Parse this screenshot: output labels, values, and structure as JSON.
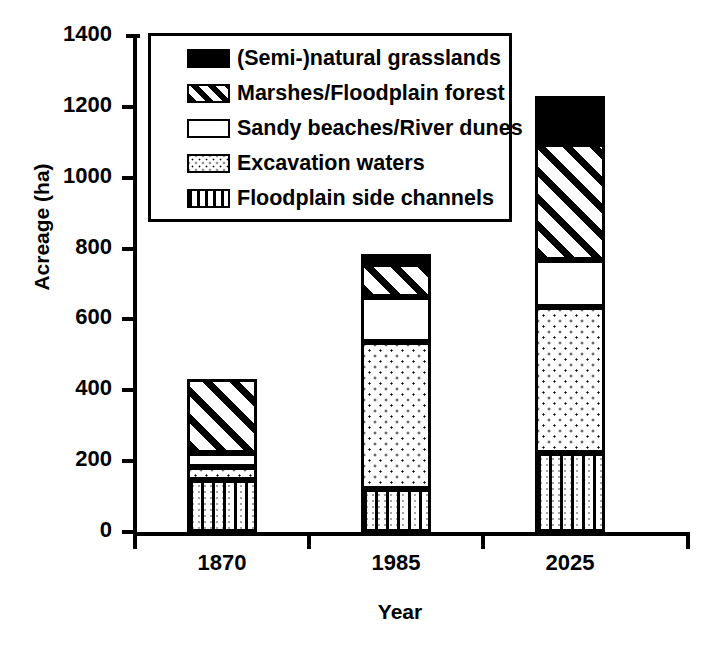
{
  "chart_data": {
    "type": "bar",
    "stacked": true,
    "title": "",
    "subtitle": "",
    "xlabel": "Year",
    "ylabel": "Acreage (ha)",
    "categories": [
      "1870",
      "1985",
      "2025"
    ],
    "ylim": [
      0,
      1400
    ],
    "ytick_step": 200,
    "ytick_labels": [
      "0",
      "200",
      "400",
      "600",
      "800",
      "1000",
      "1200",
      "1400"
    ],
    "ytick_values": [
      0,
      200,
      400,
      600,
      800,
      1000,
      1200,
      1400
    ],
    "grid": false,
    "legend_position": "upper left inside plot",
    "units": "ha",
    "series": [
      {
        "name": "Floodplain side channels",
        "fill": "fill-vert",
        "values": [
          147,
          121,
          224
        ]
      },
      {
        "name": "Excavation waters",
        "fill": "fill-dots",
        "values": [
          37,
          416,
          411
        ]
      },
      {
        "name": "Sandy beaches/River dunes",
        "fill": "fill-white",
        "values": [
          40,
          127,
          133
        ]
      },
      {
        "name": "Marshes/Floodplain forest",
        "fill": "fill-diag",
        "values": [
          207,
          93,
          328
        ]
      },
      {
        "name": "(Semi-)natural grasslands",
        "fill": "fill-solid",
        "values": [
          0,
          28,
          136
        ]
      }
    ],
    "stack_totals": [
      431,
      785,
      1232
    ]
  },
  "legend": {
    "items": [
      {
        "label": "(Semi-)natural grasslands",
        "fill": "fill-solid"
      },
      {
        "label": "Marshes/Floodplain forest",
        "fill": "fill-diag"
      },
      {
        "label": "Sandy beaches/River dunes",
        "fill": "fill-white"
      },
      {
        "label": "Excavation waters",
        "fill": "fill-dots"
      },
      {
        "label": "Floodplain side channels",
        "fill": "fill-vert"
      }
    ]
  },
  "colors": {
    "ink": "#000000",
    "paper": "#ffffff"
  }
}
